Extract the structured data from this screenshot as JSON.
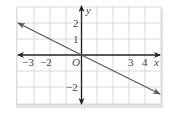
{
  "graph": {
    "line_equation": "y = -x/2",
    "x_axis_label": "x",
    "y_axis_label": "y",
    "origin_label": "O",
    "x_tick_labels": [
      "−3",
      "−2",
      "3",
      "4"
    ],
    "y_tick_labels": [
      "2",
      "1",
      "−2"
    ],
    "colors": {
      "line": "#5a5a5a",
      "axis": "#222222",
      "grid": "#c8c8c8",
      "frame_shadow": "#d0d0d0"
    }
  }
}
